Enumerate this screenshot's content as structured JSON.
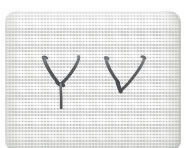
{
  "image": {
    "subject": "handwritten-letters-on-woven-fabric-swatch",
    "caption": "Two dark hand-drawn letterforms on a light grey woven mesh card",
    "width": 188,
    "height": 148,
    "background_color": "#ffffff"
  },
  "card": {
    "name": "fabric-swatch",
    "material": "woven-mesh-canvas",
    "base_color": "#ecedeb",
    "shadow_color": "#d6d7d4",
    "corner_radius_px": 12,
    "bounds": {
      "x": 5,
      "y": 11,
      "width": 176,
      "height": 141
    }
  },
  "marks": {
    "ink_color": "#55565a",
    "ink_color_light": "#7e8085",
    "items": [
      {
        "id": "mark-1",
        "glyph": "Y",
        "label": "letter-y",
        "bounds": {
          "x": 38,
          "y": 45,
          "width": 40,
          "height": 52
        },
        "stroke_width_px": 3.2
      },
      {
        "id": "mark-2",
        "glyph": "V",
        "label": "letter-v",
        "bounds": {
          "x": 100,
          "y": 46,
          "width": 40,
          "height": 36
        },
        "stroke_width_px": 3.2
      }
    ]
  }
}
